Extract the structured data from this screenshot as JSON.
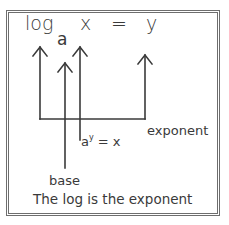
{
  "equation": {
    "log": "log",
    "base_subscript": "a",
    "argument": "x",
    "equals": "=",
    "result": "y"
  },
  "exponential_form": {
    "base": "a",
    "exponent": "y",
    "rest": "= x"
  },
  "labels": {
    "exponent": "exponent",
    "base": "base"
  },
  "caption": "The log is the exponent",
  "colors": {
    "stroke": "#3a3a3a",
    "frame": "#6e6e6e",
    "background": "#ffffff"
  }
}
